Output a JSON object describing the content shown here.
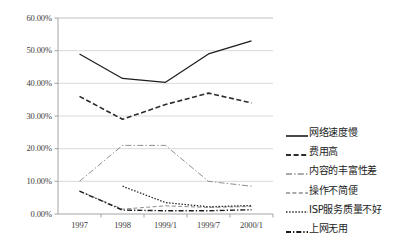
{
  "chart_data": {
    "type": "line",
    "title": "",
    "xlabel": "",
    "ylabel": "",
    "categories": [
      "1997",
      "1998",
      "1999/1",
      "1999/7",
      "2000/1"
    ],
    "ylim": [
      0,
      60
    ],
    "ytick_labels": [
      "0.00%",
      "10.00%",
      "20.00%",
      "30.00%",
      "40.00%",
      "50.00%",
      "60.00%"
    ],
    "ytick_values": [
      0,
      10,
      20,
      30,
      40,
      50,
      60
    ],
    "grid": true,
    "legend_position": "right",
    "series": [
      {
        "name": "网络速度慢",
        "values": [
          49.0,
          41.5,
          40.3,
          49.0,
          53.0
        ],
        "style": "solid",
        "color": "#1c1c1c",
        "width": 1.2
      },
      {
        "name": "费用高",
        "values": [
          36.0,
          29.0,
          33.5,
          37.0,
          34.0
        ],
        "style": "dashed",
        "color": "#2b2b2b",
        "width": 1.6
      },
      {
        "name": "内容的丰富性差",
        "values": [
          10.0,
          21.0,
          21.0,
          10.0,
          8.5
        ],
        "style": "dashdot",
        "color": "#8d8d8d",
        "width": 1.0
      },
      {
        "name": "操作不简便",
        "values": [
          7.0,
          1.5,
          2.5,
          2.0,
          2.3
        ],
        "style": "dashed-light",
        "color": "#8d8d8d",
        "width": 1.0
      },
      {
        "name": "ISP服务质量不好",
        "values": [
          null,
          8.5,
          3.5,
          2.2,
          2.6
        ],
        "style": "dotted",
        "color": "#2b2b2b",
        "width": 1.3
      },
      {
        "name": "上网无用",
        "values": [
          7.0,
          1.2,
          1.0,
          1.0,
          1.3
        ],
        "style": "dashdot-dark",
        "color": "#1c1c1c",
        "width": 1.4
      }
    ]
  },
  "legend": {
    "items": [
      {
        "label": "网络速度慢"
      },
      {
        "label": "费用高"
      },
      {
        "label": "内容的丰富性差"
      },
      {
        "label": "操作不简便"
      },
      {
        "label": "ISP服务质量不好"
      },
      {
        "label": "上网无用"
      }
    ]
  },
  "axes": {
    "colors": {
      "axis_line": "#9a9a9a",
      "gridline": "#cfcfcf",
      "tick_text": "#3b3b3b"
    }
  }
}
